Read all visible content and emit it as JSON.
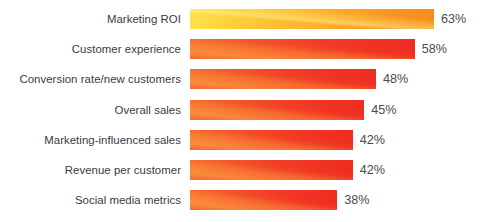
{
  "chart_data": {
    "type": "bar",
    "orientation": "horizontal",
    "title": "",
    "subtitle": "",
    "xlabel": "",
    "ylabel": "",
    "xlim": [
      0,
      63
    ],
    "grid": false,
    "legend": null,
    "value_suffix": "%",
    "categories": [
      "Marketing ROI",
      "Customer experience",
      "Conversion rate/new customers",
      "Overall sales",
      "Marketing-influenced sales",
      "Revenue per customer",
      "Social media metrics"
    ],
    "values": [
      63,
      58,
      48,
      45,
      42,
      42,
      38
    ],
    "value_labels": [
      "63%",
      "58%",
      "48%",
      "45%",
      "42%",
      "42%",
      "38%"
    ],
    "colors": {
      "bar_yellow_start": "#ffe24a",
      "bar_yellow_end": "#f78c1e",
      "bar_red_start": "#f4692c",
      "bar_red_end": "#ef2d22",
      "highlight_orange": "#fba545",
      "label_text": "#3a3a3c",
      "value_text": "#4a4a4c",
      "background": "#ffffff"
    },
    "bar_styles": [
      "yellow",
      "red",
      "red",
      "red",
      "red",
      "red",
      "red"
    ]
  },
  "rows": [
    {
      "label": "Marketing ROI",
      "value": 63,
      "value_label": "63%",
      "style": "yellow"
    },
    {
      "label": "Customer experience",
      "value": 58,
      "value_label": "58%",
      "style": "red"
    },
    {
      "label": "Conversion rate/new customers",
      "value": 48,
      "value_label": "48%",
      "style": "red"
    },
    {
      "label": "Overall sales",
      "value": 45,
      "value_label": "45%",
      "style": "red"
    },
    {
      "label": "Marketing-influenced sales",
      "value": 42,
      "value_label": "42%",
      "style": "red"
    },
    {
      "label": "Revenue per customer",
      "value": 42,
      "value_label": "42%",
      "style": "red"
    },
    {
      "label": "Social media metrics",
      "value": 38,
      "value_label": "38%",
      "style": "red"
    }
  ]
}
